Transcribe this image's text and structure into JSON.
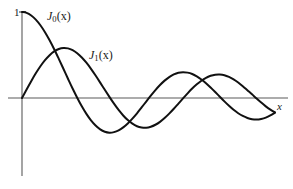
{
  "figure": {
    "background_color": "#ffffff",
    "width": 293,
    "height": 189
  },
  "labels": {
    "j0_base": "J",
    "j0_order": "0",
    "j0_arg": "(x)",
    "j1_base": "J",
    "j1_order": "1",
    "j1_arg": "(x)",
    "x_axis": "x",
    "y_tick_one": "1"
  },
  "axes": {
    "origin_px": [
      22,
      98
    ],
    "y_axis_top_px": 12,
    "y_axis_bottom_px": 176,
    "x_axis_right_px": 288,
    "x_axis_color": "#5a5a5a",
    "y_axis_color": "#5a5a5a",
    "tick_label_value": 1,
    "px_per_x_unit": 23.0,
    "px_per_y_unit": 86.0,
    "grid": false,
    "legend": "inline-annotations"
  },
  "chart_data": {
    "type": "line",
    "title": "",
    "subtitle": "",
    "xlabel": "x",
    "ylabel": "",
    "xlim": [
      0,
      11.6
    ],
    "ylim": [
      -0.45,
      1.0
    ],
    "grid": false,
    "legend_position": "inline",
    "annotations": [
      {
        "text": "J_0(x)",
        "x": 1.1,
        "y": 0.93
      },
      {
        "text": "J_1(x)",
        "x": 2.9,
        "y": 0.54
      },
      {
        "text": "x",
        "x": 11.1,
        "y": -0.04
      },
      {
        "text": "1",
        "x": -0.35,
        "y": 1.0
      }
    ],
    "x": [
      0,
      0.2,
      0.4,
      0.6,
      0.8,
      1.0,
      1.2,
      1.4,
      1.6,
      1.8,
      2.0,
      2.2,
      2.4,
      2.6,
      2.8,
      3.0,
      3.2,
      3.4,
      3.6,
      3.8,
      4.0,
      4.2,
      4.4,
      4.6,
      4.8,
      5.0,
      5.2,
      5.4,
      5.6,
      5.8,
      6.0,
      6.2,
      6.4,
      6.6,
      6.8,
      7.0,
      7.2,
      7.4,
      7.6,
      7.8,
      8.0,
      8.2,
      8.4,
      8.6,
      8.8,
      9.0,
      9.2,
      9.4,
      9.6,
      9.8,
      10.0,
      10.2,
      10.4,
      10.6,
      10.8,
      11.0
    ],
    "series": [
      {
        "name": "J_0(x)",
        "color": "#111111",
        "values": [
          1.0,
          0.99,
          0.96,
          0.912,
          0.846,
          0.765,
          0.671,
          0.567,
          0.455,
          0.34,
          0.224,
          0.11,
          0.003,
          -0.097,
          -0.185,
          -0.26,
          -0.32,
          -0.364,
          -0.392,
          -0.403,
          -0.397,
          -0.377,
          -0.342,
          -0.296,
          -0.24,
          -0.178,
          -0.11,
          -0.041,
          0.027,
          0.092,
          0.151,
          0.202,
          0.243,
          0.274,
          0.294,
          0.3,
          0.295,
          0.279,
          0.251,
          0.215,
          0.172,
          0.122,
          0.069,
          0.015,
          -0.039,
          -0.09,
          -0.137,
          -0.177,
          -0.209,
          -0.232,
          -0.246,
          -0.25,
          -0.243,
          -0.228,
          -0.203,
          -0.171
        ]
      },
      {
        "name": "J_1(x)",
        "color": "#111111",
        "values": [
          0.0,
          0.0995,
          0.196,
          0.287,
          0.369,
          0.44,
          0.498,
          0.542,
          0.57,
          0.582,
          0.577,
          0.556,
          0.52,
          0.471,
          0.41,
          0.339,
          0.261,
          0.179,
          0.095,
          0.013,
          -0.066,
          -0.139,
          -0.203,
          -0.257,
          -0.298,
          -0.328,
          -0.343,
          -0.346,
          -0.334,
          -0.311,
          -0.277,
          -0.233,
          -0.182,
          -0.125,
          -0.065,
          -0.005,
          0.054,
          0.11,
          0.159,
          0.201,
          0.235,
          0.258,
          0.271,
          0.273,
          0.265,
          0.245,
          0.217,
          0.18,
          0.137,
          0.09,
          0.043,
          -0.006,
          -0.053,
          -0.097,
          -0.135,
          -0.167
        ]
      }
    ]
  }
}
